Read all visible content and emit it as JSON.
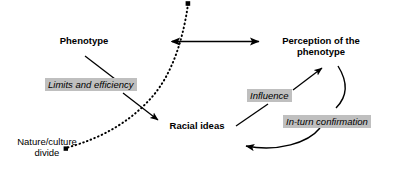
{
  "diagram": {
    "background_color": "#ffffff",
    "line_color": "#000000",
    "tag_background_color": "#bfbfbf",
    "nodes": [
      {
        "id": "phenotype",
        "label": "Phenotype",
        "style": "bold"
      },
      {
        "id": "perception_line1",
        "label": "Perception of the",
        "style": "bold"
      },
      {
        "id": "perception_line2",
        "label": "phenotype",
        "style": "bold"
      },
      {
        "id": "racial_ideas",
        "label": "Racial ideas",
        "style": "bold"
      },
      {
        "id": "nature_culture_line1",
        "label": "Nature/culture",
        "style": "plain"
      },
      {
        "id": "nature_culture_line2",
        "label": "divide",
        "style": "plain"
      }
    ],
    "tags": [
      {
        "id": "limits_efficiency",
        "label": "Limits and efficiency"
      },
      {
        "id": "influence",
        "label": "Influence"
      },
      {
        "id": "in_turn_confirmation",
        "label": "In-turn confirmation"
      }
    ],
    "connectors": [
      {
        "id": "phenotype-perception",
        "kind": "double-arrow",
        "from": "phenotype",
        "to": "perception"
      },
      {
        "id": "phenotype-limits",
        "kind": "line",
        "from": "phenotype",
        "to": "limits_efficiency"
      },
      {
        "id": "limits-racial-ideas",
        "kind": "arrow",
        "from": "limits_efficiency",
        "to": "racial_ideas"
      },
      {
        "id": "racial-ideas-influence-perception",
        "kind": "arrow",
        "from": "racial_ideas",
        "to": "perception"
      },
      {
        "id": "perception-racial-ideas-curve",
        "kind": "curved-arrow",
        "from": "perception",
        "to": "racial_ideas"
      },
      {
        "id": "nature-culture-divide-curve",
        "kind": "dotted-curve",
        "from": "nature_culture_divide",
        "to": "top"
      }
    ]
  }
}
